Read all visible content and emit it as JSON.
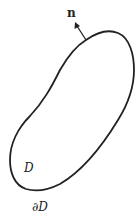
{
  "diagram": {
    "normal_label": "n",
    "region_label": "D",
    "boundary_label": "∂D",
    "stroke_color": "#222222",
    "background": "#ffffff"
  }
}
